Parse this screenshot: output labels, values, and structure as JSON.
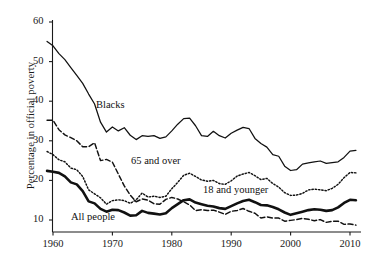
{
  "chart_data": {
    "type": "line",
    "title": "",
    "xlabel": "",
    "ylabel": "Percentage in official poverty",
    "xlim": [
      1959,
      2011
    ],
    "ylim": [
      6,
      62
    ],
    "grid": false,
    "legend_position": "inline-annotations",
    "xticks": [
      1960,
      1970,
      1980,
      1990,
      2000,
      2010
    ],
    "yticks": [
      10,
      20,
      30,
      40,
      50,
      60
    ],
    "x": [
      1959,
      1960,
      1961,
      1962,
      1963,
      1964,
      1965,
      1966,
      1967,
      1968,
      1969,
      1970,
      1971,
      1972,
      1973,
      1974,
      1975,
      1976,
      1977,
      1978,
      1979,
      1980,
      1981,
      1982,
      1983,
      1984,
      1985,
      1986,
      1987,
      1988,
      1989,
      1990,
      1991,
      1992,
      1993,
      1994,
      1995,
      1996,
      1997,
      1998,
      1999,
      2000,
      2001,
      2002,
      2003,
      2004,
      2005,
      2006,
      2007,
      2008,
      2009,
      2010,
      2011
    ],
    "series": [
      {
        "name": "Blacks",
        "style": "solid-thin",
        "values": [
          55.1,
          54.0,
          52.0,
          50.5,
          48.5,
          46.5,
          44.5,
          41.8,
          39.3,
          34.7,
          32.2,
          33.5,
          32.5,
          33.3,
          31.4,
          30.3,
          31.3,
          31.1,
          31.3,
          30.6,
          31.0,
          32.5,
          34.2,
          35.6,
          35.7,
          33.8,
          31.3,
          31.1,
          32.4,
          31.3,
          30.7,
          31.9,
          32.7,
          33.4,
          33.1,
          30.6,
          29.3,
          28.4,
          26.5,
          26.1,
          23.6,
          22.5,
          22.7,
          24.1,
          24.4,
          24.7,
          24.9,
          24.3,
          24.5,
          24.7,
          25.8,
          27.4,
          27.6
        ]
      },
      {
        "name": "65 and over",
        "style": "dashed",
        "values": [
          35.2,
          35.2,
          32.8,
          31.5,
          30.8,
          30.0,
          28.5,
          28.5,
          29.5,
          25.0,
          25.3,
          24.6,
          21.6,
          18.6,
          16.3,
          14.6,
          15.3,
          15.0,
          14.1,
          14.0,
          15.2,
          15.7,
          15.3,
          14.6,
          13.8,
          12.4,
          12.6,
          12.4,
          12.5,
          12.0,
          11.4,
          12.2,
          12.4,
          12.9,
          12.2,
          11.7,
          10.5,
          10.8,
          10.5,
          10.5,
          9.7,
          9.9,
          10.1,
          10.4,
          10.2,
          9.8,
          10.1,
          9.4,
          9.7,
          9.7,
          8.9,
          9.0,
          8.7
        ]
      },
      {
        "name": "18 and younger",
        "style": "dotted",
        "values": [
          27.3,
          26.5,
          25.2,
          24.7,
          23.1,
          22.7,
          21.0,
          17.6,
          16.6,
          15.6,
          14.0,
          14.9,
          15.1,
          14.9,
          14.2,
          15.1,
          16.8,
          15.8,
          16.0,
          15.7,
          16.0,
          17.9,
          19.5,
          21.3,
          21.8,
          21.0,
          20.1,
          19.8,
          20.0,
          19.2,
          19.0,
          19.9,
          21.1,
          21.6,
          22.0,
          21.2,
          20.2,
          20.5,
          19.2,
          18.3,
          16.9,
          16.2,
          16.3,
          16.7,
          17.6,
          17.8,
          17.6,
          17.4,
          18.0,
          19.0,
          20.7,
          22.0,
          21.9
        ]
      },
      {
        "name": "All people",
        "style": "solid-thick",
        "values": [
          22.4,
          22.2,
          21.9,
          21.0,
          19.5,
          19.0,
          17.3,
          14.7,
          14.2,
          12.8,
          12.1,
          12.6,
          12.5,
          11.9,
          11.1,
          11.2,
          12.3,
          11.8,
          11.6,
          11.4,
          11.7,
          13.0,
          14.0,
          15.0,
          15.2,
          14.4,
          14.0,
          13.6,
          13.4,
          13.0,
          12.8,
          13.5,
          14.2,
          14.8,
          15.1,
          14.5,
          13.8,
          13.7,
          13.3,
          12.7,
          11.9,
          11.3,
          11.7,
          12.1,
          12.5,
          12.7,
          12.6,
          12.3,
          12.5,
          13.2,
          14.3,
          15.1,
          15.0
        ]
      }
    ],
    "annotations": [
      {
        "text": "Blacks",
        "x_px": 96,
        "y_px": 99
      },
      {
        "text": "65 and over",
        "x_px": 131,
        "y_px": 155
      },
      {
        "text": "18 and younger",
        "x_px": 203,
        "y_px": 184
      },
      {
        "text": "All people",
        "x_px": 71,
        "y_px": 211
      }
    ],
    "colors": {
      "axis": "#1a1a1a",
      "line": "#111111",
      "background": "#ffffff"
    }
  }
}
